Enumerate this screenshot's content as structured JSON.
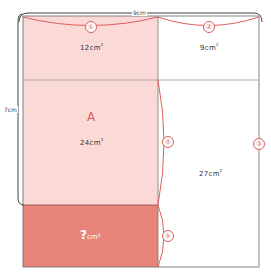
{
  "colors": {
    "light_region": "#fbd9d7",
    "dark_region": "#e8857a",
    "accent": "#d9605a",
    "line": "#555555",
    "white": "#ffffff"
  },
  "dimensions": {
    "width_label": "9cm",
    "height_label": "7cm"
  },
  "regions": {
    "top_left": {
      "area": "12cm",
      "sup": "2"
    },
    "top_right": {
      "area": "9cm",
      "sup": "2"
    },
    "middle_left": {
      "letter": "A",
      "area": "24cm",
      "sup": "2"
    },
    "right_lower": {
      "area": "27cm",
      "sup": "2"
    },
    "bottom_left": {
      "question": "?",
      "unit": "cm²"
    }
  },
  "markers": [
    "①",
    "②",
    "③",
    "④",
    "⑤"
  ]
}
